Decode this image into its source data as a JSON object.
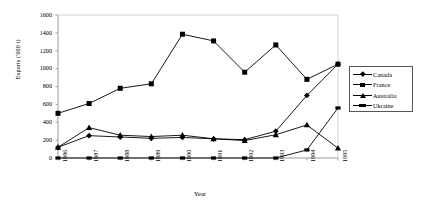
{
  "chart_data": {
    "type": "line",
    "title": "",
    "xlabel": "Year",
    "ylabel": "Exports ('000 t)",
    "categories": [
      "1986",
      "1987",
      "1988",
      "1989",
      "1990",
      "1991",
      "1992",
      "1993",
      "1994",
      "1995"
    ],
    "ylim": [
      0,
      1600
    ],
    "yticks": [
      0,
      200,
      400,
      600,
      800,
      1000,
      1200,
      1400,
      1600
    ],
    "grid": false,
    "legend_position": "right",
    "series": [
      {
        "name": "Canada",
        "marker": "diamond",
        "color": "#000000",
        "values": [
          120,
          250,
          235,
          220,
          230,
          215,
          205,
          300,
          700,
          1050
        ]
      },
      {
        "name": "France",
        "marker": "square",
        "color": "#000000",
        "values": [
          500,
          610,
          780,
          830,
          1385,
          1310,
          960,
          1265,
          880,
          1050
        ]
      },
      {
        "name": "Australia",
        "marker": "triangle",
        "color": "#000000",
        "values": [
          120,
          340,
          255,
          240,
          255,
          215,
          195,
          260,
          370,
          110
        ]
      },
      {
        "name": "Ukraine",
        "marker": "dash",
        "color": "#000000",
        "values": [
          0,
          0,
          0,
          0,
          0,
          0,
          0,
          0,
          90,
          560
        ]
      }
    ]
  },
  "legend": {
    "items": [
      {
        "label": "Canada"
      },
      {
        "label": "France"
      },
      {
        "label": "Australia"
      },
      {
        "label": "Ukraine"
      }
    ]
  },
  "axes": {
    "y_title": "Exports ('000 t)",
    "x_title": "Year",
    "y_ticks": [
      "1600",
      "1400",
      "1200",
      "1000",
      "800",
      "600",
      "400",
      "200",
      "0"
    ],
    "x_ticks": [
      "1986",
      "1987",
      "1988",
      "1989",
      "1990",
      "1991",
      "1992",
      "1993",
      "1994",
      "1995"
    ]
  }
}
